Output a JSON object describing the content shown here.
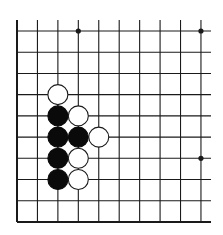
{
  "board": {
    "description": "Go board corner diagram (bottom-left region)",
    "columns": 10,
    "rows": 10,
    "origin_x": 17,
    "origin_y": 31,
    "spacing_x": 20.44,
    "spacing_y": 21.22,
    "vertical_top": 20,
    "horizontal_right": 211,
    "line_color": "#1a1a1a",
    "border_edges": [
      "left",
      "bottom"
    ],
    "star_points": [
      {
        "col": 3,
        "row": 0
      },
      {
        "col": 9,
        "row": 0
      },
      {
        "col": 9,
        "row": 6
      }
    ],
    "stone_radius": 10,
    "stones": [
      {
        "color": "white",
        "col": 2,
        "row": 3
      },
      {
        "color": "black",
        "col": 2,
        "row": 4
      },
      {
        "color": "white",
        "col": 3,
        "row": 4
      },
      {
        "color": "black",
        "col": 2,
        "row": 5
      },
      {
        "color": "black",
        "col": 3,
        "row": 5
      },
      {
        "color": "white",
        "col": 4,
        "row": 5
      },
      {
        "color": "black",
        "col": 2,
        "row": 6
      },
      {
        "color": "white",
        "col": 3,
        "row": 6
      },
      {
        "color": "black",
        "col": 2,
        "row": 7
      },
      {
        "color": "white",
        "col": 3,
        "row": 7
      }
    ],
    "colors": {
      "black_stone": "#0a0a0a",
      "white_stone_fill": "#ffffff",
      "white_stone_stroke": "#1a1a1a"
    }
  }
}
